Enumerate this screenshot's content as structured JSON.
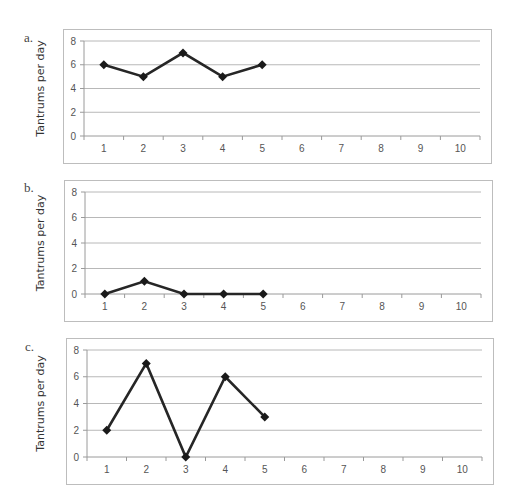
{
  "chart_data": [
    {
      "type": "line",
      "panel": "a.",
      "title": "",
      "xlabel": "",
      "ylabel": "Tantrums per day",
      "categories": [
        "1",
        "2",
        "3",
        "4",
        "5",
        "6",
        "7",
        "8",
        "9",
        "10"
      ],
      "yticks": [
        0,
        2,
        4,
        6,
        8
      ],
      "ylim": [
        0,
        8
      ],
      "grid": true,
      "legend": null,
      "series": [
        {
          "name": "Tantrums",
          "x": [
            1,
            2,
            3,
            4,
            5
          ],
          "values": [
            6,
            5,
            7,
            5,
            6
          ]
        }
      ]
    },
    {
      "type": "line",
      "panel": "b.",
      "title": "",
      "xlabel": "",
      "ylabel": "Tantrums per day",
      "categories": [
        "1",
        "2",
        "3",
        "4",
        "5",
        "6",
        "7",
        "8",
        "9",
        "10"
      ],
      "yticks": [
        0,
        2,
        4,
        6,
        8
      ],
      "ylim": [
        0,
        8
      ],
      "grid": true,
      "legend": null,
      "series": [
        {
          "name": "Tantrums",
          "x": [
            1,
            2,
            3,
            4,
            5
          ],
          "values": [
            0,
            1,
            0,
            0,
            0
          ]
        }
      ]
    },
    {
      "type": "line",
      "panel": "c.",
      "title": "",
      "xlabel": "",
      "ylabel": "Tantrums per day",
      "categories": [
        "1",
        "2",
        "3",
        "4",
        "5",
        "6",
        "7",
        "8",
        "9",
        "10"
      ],
      "yticks": [
        0,
        2,
        4,
        6,
        8
      ],
      "ylim": [
        0,
        8
      ],
      "grid": true,
      "legend": null,
      "series": [
        {
          "name": "Tantrums",
          "x": [
            1,
            2,
            3,
            4,
            5
          ],
          "values": [
            2,
            7,
            0,
            6,
            3
          ]
        }
      ]
    }
  ],
  "panels": [
    {
      "letter": "a.",
      "ylabel": "Tantrums per day"
    },
    {
      "letter": "b.",
      "ylabel": "Tantrums per day"
    },
    {
      "letter": "c.",
      "ylabel": "Tantrums per day"
    }
  ],
  "colors": {
    "line": "#262626",
    "marker": "#1a1a1a",
    "grid": "#b8b8b8",
    "frame": "#bdbdbd"
  }
}
